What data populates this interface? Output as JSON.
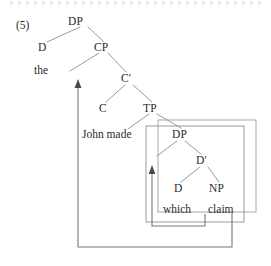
{
  "figure": {
    "example_number": "(5)",
    "type": "syntax-tree"
  },
  "tree": {
    "nodes": [
      {
        "id": "dp-top",
        "label": "DP",
        "x": 78,
        "y": 21,
        "kind": "category"
      },
      {
        "id": "d-top",
        "label": "D",
        "x": 42,
        "y": 47,
        "kind": "category"
      },
      {
        "id": "cp",
        "label": "CP",
        "x": 98,
        "y": 47,
        "kind": "category"
      },
      {
        "id": "the",
        "label": "the",
        "x": 38,
        "y": 70,
        "kind": "terminal"
      },
      {
        "id": "cbar",
        "label": "C′",
        "x": 126,
        "y": 79,
        "kind": "category"
      },
      {
        "id": "c",
        "label": "C",
        "x": 103,
        "y": 108,
        "kind": "category"
      },
      {
        "id": "tp",
        "label": "TP",
        "x": 148,
        "y": 108,
        "kind": "category"
      },
      {
        "id": "johnmade",
        "label": "John made",
        "x": 82,
        "y": 131,
        "kind": "terminal"
      },
      {
        "id": "dp-inner",
        "label": "DP",
        "x": 175,
        "y": 133,
        "kind": "category"
      },
      {
        "id": "dbar",
        "label": "D′",
        "x": 200,
        "y": 160,
        "kind": "category"
      },
      {
        "id": "d-inner",
        "label": "D",
        "x": 177,
        "y": 188,
        "kind": "category"
      },
      {
        "id": "np",
        "label": "NP",
        "x": 213,
        "y": 188,
        "kind": "category"
      },
      {
        "id": "which",
        "label": "which",
        "x": 165,
        "y": 209,
        "kind": "terminal"
      },
      {
        "id": "claim",
        "label": "claim",
        "x": 211,
        "y": 209,
        "kind": "terminal"
      }
    ],
    "branches": [
      {
        "from": "dp-top",
        "to": "d-top",
        "x1": 80,
        "y1": 27,
        "x2": 47,
        "y2": 42
      },
      {
        "from": "dp-top",
        "to": "cp",
        "x1": 88,
        "y1": 27,
        "x2": 104,
        "y2": 42
      },
      {
        "from": "cp",
        "to": "spec-cp",
        "x1": 99,
        "y1": 53,
        "x2": 70,
        "y2": 70
      },
      {
        "from": "cp",
        "to": "cbar",
        "x1": 108,
        "y1": 53,
        "x2": 126,
        "y2": 72
      },
      {
        "from": "cbar",
        "to": "c",
        "x1": 126,
        "y1": 85,
        "x2": 106,
        "y2": 102
      },
      {
        "from": "cbar",
        "to": "tp",
        "x1": 134,
        "y1": 85,
        "x2": 152,
        "y2": 102
      },
      {
        "from": "tp",
        "to": "vp-left",
        "x1": 150,
        "y1": 114,
        "x2": 128,
        "y2": 128
      },
      {
        "from": "tp",
        "to": "dp-inner",
        "x1": 158,
        "y1": 114,
        "x2": 180,
        "y2": 128
      },
      {
        "from": "dp-inner",
        "to": "spec-dp",
        "x1": 177,
        "y1": 140,
        "x2": 156,
        "y2": 155
      },
      {
        "from": "dp-inner",
        "to": "dbar",
        "x1": 186,
        "y1": 140,
        "x2": 201,
        "y2": 154
      },
      {
        "from": "dbar",
        "to": "d-inner",
        "x1": 201,
        "y1": 166,
        "x2": 181,
        "y2": 182
      },
      {
        "from": "dbar",
        "to": "np",
        "x1": 209,
        "y1": 166,
        "x2": 218,
        "y2": 182
      }
    ]
  },
  "movement_arrows": [
    {
      "id": "outer-movement",
      "description": "wh-movement of DP from object position to Spec,CP",
      "path": "M 205 213 L 205 245 L 78 245 L 78 84",
      "arrowhead": {
        "x": 78,
        "y": 82,
        "direction": "up"
      }
    },
    {
      "id": "inner-movement",
      "description": "movement of NP claim to Spec,DP",
      "path": "M 205 214 L 205 226 L 152 226 L 152 170",
      "arrowhead": {
        "x": 152,
        "y": 168,
        "direction": "up"
      }
    }
  ],
  "boxes": [
    {
      "id": "outer-box",
      "x": 158,
      "y": 120,
      "width": 98,
      "height": 92
    },
    {
      "id": "inner-box",
      "x": 146,
      "y": 126,
      "width": 98,
      "height": 96
    }
  ],
  "style": {
    "line_color": "#8a8a8a",
    "box_color": "#9a9a9a",
    "arrow_color": "#6f6f6f",
    "text_color": "#2b2b2b",
    "background": "#ffffff"
  }
}
